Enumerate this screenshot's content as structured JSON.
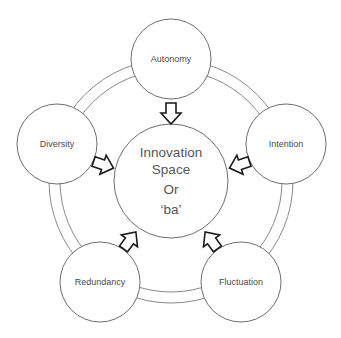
{
  "diagram": {
    "center": {
      "lines": [
        "Innovation",
        "Space",
        "Or",
        "‘ba’"
      ]
    },
    "nodes": [
      {
        "id": "autonomy",
        "label": "Autonomy"
      },
      {
        "id": "intention",
        "label": "Intention"
      },
      {
        "id": "fluctuation",
        "label": "Fluctuation"
      },
      {
        "id": "redundancy",
        "label": "Redundancy"
      },
      {
        "id": "diversity",
        "label": "Diversity"
      }
    ],
    "edges": [
      {
        "from": "autonomy",
        "to": "center",
        "type": "block-arrow"
      },
      {
        "from": "intention",
        "to": "center",
        "type": "block-arrow"
      },
      {
        "from": "fluctuation",
        "to": "center",
        "type": "block-arrow"
      },
      {
        "from": "redundancy",
        "to": "center",
        "type": "block-arrow"
      },
      {
        "from": "diversity",
        "to": "center",
        "type": "block-arrow"
      }
    ],
    "ring": "double-circle connecting outer nodes",
    "colors": {
      "background": "#ffffff",
      "circle_stroke": "#6e6e6e",
      "arrow_stroke": "#1a1a1a",
      "text": "#4a4a4a"
    }
  }
}
